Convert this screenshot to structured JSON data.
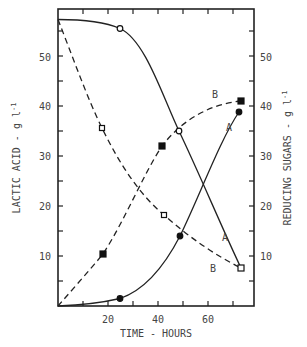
{
  "chart_data": {
    "type": "line",
    "title": "",
    "xlabel": "TIME - HOURS",
    "ylabel": "LACTIC ACID - g l⁻¹",
    "ylabel_right": "REDUCING SUGARS - g l⁻¹",
    "xlim": [
      0,
      78
    ],
    "ylim": [
      0,
      59
    ],
    "ylim_right": [
      0,
      59
    ],
    "x_ticks": [
      20,
      40,
      60
    ],
    "x_minor_ticks": [
      10,
      30,
      50,
      70
    ],
    "y_ticks": [
      10,
      20,
      30,
      40,
      50
    ],
    "y_ticks_right": [
      10,
      20,
      30,
      40,
      50
    ],
    "grid": false,
    "legend": "inline curve labels A and B",
    "series": [
      {
        "name": "Reducing sugars A",
        "axis": "right",
        "curve_label": "A",
        "line": "solid",
        "marker": "open-circle",
        "x": [
          0,
          25,
          48.5,
          73
        ],
        "values": [
          57.5,
          55.5,
          35,
          7.5
        ]
      },
      {
        "name": "Lactic acid A",
        "axis": "left",
        "curve_label": "A",
        "line": "solid",
        "marker": "filled-circle",
        "x": [
          0,
          25,
          49,
          72
        ],
        "values": [
          0,
          1.5,
          14,
          39
        ]
      },
      {
        "name": "Reducing sugars B",
        "axis": "right",
        "curve_label": "B",
        "line": "dashed",
        "marker": "open-square",
        "x": [
          0,
          18,
          42.5,
          73
        ],
        "values": [
          57.5,
          35.5,
          18,
          7.5
        ]
      },
      {
        "name": "Lactic acid B",
        "axis": "left",
        "curve_label": "B",
        "line": "dashed",
        "marker": "filled-square",
        "x": [
          0,
          18,
          41.5,
          73
        ],
        "values": [
          0,
          10.4,
          32,
          41
        ]
      }
    ],
    "annotations": [
      {
        "text": "B",
        "near": "lactic acid B end",
        "x": 68,
        "y": 42.5
      },
      {
        "text": "A",
        "near": "lactic acid A end",
        "x": 71,
        "y": 35
      },
      {
        "text": "A",
        "near": "sugars A end",
        "x": 69,
        "y": 13.5
      },
      {
        "text": "B",
        "near": "sugars B end",
        "x": 66,
        "y": 7
      }
    ]
  },
  "labels": {
    "xlabel": "TIME - HOURS",
    "ylabel_left": "LACTIC ACID  -  g l",
    "ylabel_left_sup": "-1",
    "ylabel_right": "REDUCING SUGARS  -  g l",
    "ylabel_right_sup": "-1",
    "x_tick_labels": [
      "20",
      "40",
      "60"
    ],
    "y_tick_labels": [
      "10",
      "20",
      "30",
      "40",
      "50"
    ],
    "curve_A": "A",
    "curve_B": "B"
  }
}
